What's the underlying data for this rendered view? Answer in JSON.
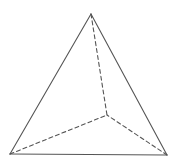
{
  "diagram": {
    "width": 182,
    "height": 163,
    "background": "#ffffff",
    "stroke_color": "#555555",
    "stroke_width": 1.1,
    "dash_pattern": "4,3",
    "vertices": {
      "apex": [
        91,
        14
      ],
      "bottom_left": [
        10,
        154
      ],
      "bottom_right": [
        167,
        155
      ],
      "hidden": [
        107,
        115
      ]
    },
    "visible_edges": [
      [
        "apex",
        "bottom_left"
      ],
      [
        "apex",
        "bottom_right"
      ],
      [
        "bottom_left",
        "bottom_right"
      ]
    ],
    "hidden_edges": [
      [
        "apex",
        "hidden"
      ],
      [
        "bottom_left",
        "hidden"
      ],
      [
        "bottom_right",
        "hidden"
      ]
    ]
  }
}
